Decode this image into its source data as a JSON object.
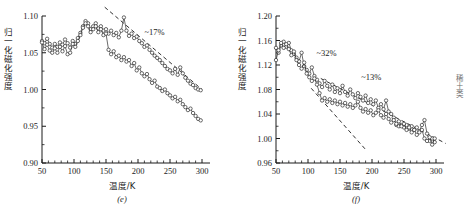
{
  "figure": {
    "edge_text": "稀土类",
    "panels": [
      {
        "id": "e",
        "panel_label": "(e)",
        "annotations": [
          {
            "text": "~17%"
          }
        ]
      },
      {
        "id": "f",
        "panel_label": "(f)",
        "annotations": [
          {
            "text": "~32%"
          },
          {
            "text": "~13%"
          }
        ]
      }
    ]
  },
  "chart_data": [
    {
      "type": "line",
      "id": "e",
      "title": "",
      "panel_label": "(e)",
      "xlabel": "温度/K",
      "ylabel": "归一化磁化强度",
      "xlim": [
        50,
        300
      ],
      "ylim": [
        0.9,
        1.1
      ],
      "xticks": [
        50,
        100,
        150,
        200,
        250,
        300
      ],
      "yticks": [
        0.9,
        0.95,
        1.0,
        1.05,
        1.1
      ],
      "grid": false,
      "legend": "none",
      "marker": "open-circle",
      "annotations": [
        {
          "text": "~17%",
          "x": 232,
          "y": 1.077
        }
      ],
      "trend_lines": [
        {
          "style": "dashed",
          "x": [
            148,
            300
          ],
          "y": [
            1.112,
            1.0
          ]
        }
      ],
      "series": [
        {
          "name": "upper-curve",
          "x": [
            50,
            54,
            58,
            62,
            66,
            70,
            74,
            78,
            82,
            86,
            90,
            94,
            98,
            102,
            106,
            110,
            114,
            118,
            122,
            126,
            130,
            134,
            138,
            142,
            146,
            150,
            154,
            158,
            162,
            166,
            170,
            174,
            178,
            182,
            186,
            190,
            194,
            198,
            202,
            206,
            210,
            214,
            218,
            222,
            226,
            230,
            234,
            238,
            242,
            246,
            250,
            254,
            258,
            262,
            266,
            270,
            274,
            278,
            282,
            286,
            290,
            294,
            298
          ],
          "y": [
            1.066,
            1.063,
            1.069,
            1.062,
            1.057,
            1.062,
            1.058,
            1.064,
            1.061,
            1.068,
            1.063,
            1.057,
            1.066,
            1.062,
            1.07,
            1.077,
            1.086,
            1.093,
            1.09,
            1.082,
            1.086,
            1.09,
            1.083,
            1.086,
            1.08,
            1.082,
            1.076,
            1.08,
            1.074,
            1.077,
            1.071,
            1.08,
            1.098,
            1.08,
            1.073,
            1.076,
            1.07,
            1.072,
            1.066,
            1.063,
            1.058,
            1.06,
            1.054,
            1.05,
            1.046,
            1.043,
            1.04,
            1.036,
            1.032,
            1.028,
            1.026,
            1.022,
            1.028,
            1.02,
            1.03,
            1.022,
            1.016,
            1.012,
            1.008,
            1.006,
            1.002,
            1.0,
            0.999
          ]
        },
        {
          "name": "lower-curve",
          "x": [
            50,
            54,
            58,
            62,
            66,
            70,
            74,
            78,
            82,
            86,
            90,
            94,
            98,
            102,
            106,
            110,
            114,
            118,
            122,
            126,
            130,
            134,
            138,
            142,
            146,
            150,
            154,
            158,
            162,
            166,
            170,
            174,
            178,
            182,
            186,
            190,
            194,
            198,
            202,
            206,
            210,
            214,
            218,
            222,
            226,
            230,
            234,
            238,
            242,
            246,
            250,
            254,
            258,
            262,
            266,
            270,
            274,
            278,
            282,
            286,
            290,
            294,
            298
          ],
          "y": [
            1.064,
            1.055,
            1.061,
            1.053,
            1.05,
            1.056,
            1.05,
            1.058,
            1.052,
            1.059,
            1.048,
            1.05,
            1.062,
            1.058,
            1.066,
            1.074,
            1.084,
            1.09,
            1.086,
            1.078,
            1.082,
            1.086,
            1.078,
            1.082,
            1.074,
            1.076,
            1.054,
            1.048,
            1.052,
            1.044,
            1.046,
            1.04,
            1.044,
            1.038,
            1.04,
            1.032,
            1.036,
            1.026,
            1.03,
            1.022,
            1.018,
            1.021,
            1.014,
            1.009,
            1.012,
            1.004,
            1.002,
            0.998,
            1.0,
            0.995,
            0.992,
            0.988,
            0.99,
            0.984,
            0.986,
            0.98,
            0.976,
            0.972,
            0.974,
            0.968,
            0.964,
            0.96,
            0.958
          ]
        }
      ]
    },
    {
      "type": "line",
      "id": "f",
      "title": "",
      "panel_label": "(f)",
      "xlabel": "温度/K",
      "ylabel": "归一化磁化强度",
      "xlim": [
        50,
        300
      ],
      "ylim": [
        0.96,
        1.2
      ],
      "xticks": [
        50,
        100,
        150,
        200,
        250,
        300
      ],
      "yticks": [
        0.96,
        1.0,
        1.04,
        1.08,
        1.12,
        1.16,
        1.2
      ],
      "grid": false,
      "legend": "none",
      "marker": "open-circle",
      "annotations": [
        {
          "text": "~32%",
          "x": 135,
          "y": 1.138
        },
        {
          "text": "~13%",
          "x": 205,
          "y": 1.098
        }
      ],
      "trend_lines": [
        {
          "style": "dashed",
          "x": [
            120,
            315
          ],
          "y": [
            1.098,
            0.992
          ]
        },
        {
          "style": "dashed",
          "x": [
            105,
            190
          ],
          "y": [
            1.082,
            0.982
          ]
        }
      ],
      "series": [
        {
          "name": "curve-a",
          "x": [
            50,
            54,
            58,
            62,
            66,
            70,
            74,
            78,
            82,
            86,
            90,
            94,
            98,
            102,
            106,
            110,
            114,
            118,
            122,
            126,
            130,
            134,
            138,
            142,
            146,
            150,
            154,
            158,
            162,
            166,
            170,
            174,
            178,
            182,
            186,
            190,
            194,
            198,
            202,
            206,
            210,
            214,
            218,
            222,
            226,
            230,
            234,
            238,
            242,
            246,
            250,
            254,
            258,
            262,
            266,
            270,
            274,
            278,
            282,
            286,
            290,
            294,
            298
          ],
          "y": [
            1.148,
            1.14,
            1.152,
            1.158,
            1.15,
            1.156,
            1.144,
            1.138,
            1.132,
            1.126,
            1.14,
            1.118,
            1.112,
            1.106,
            1.116,
            1.102,
            1.096,
            1.09,
            1.084,
            1.094,
            1.086,
            1.08,
            1.088,
            1.076,
            1.082,
            1.074,
            1.086,
            1.076,
            1.07,
            1.08,
            1.072,
            1.066,
            1.074,
            1.068,
            1.062,
            1.07,
            1.058,
            1.064,
            1.056,
            1.062,
            1.05,
            1.056,
            1.048,
            1.062,
            1.044,
            1.04,
            1.034,
            1.022,
            1.02,
            1.022,
            1.018,
            1.022,
            1.016,
            1.02,
            1.014,
            1.018,
            1.012,
            1.022,
            1.03,
            1.008,
            0.996,
            1.0,
            0.994
          ]
        },
        {
          "name": "curve-b",
          "x": [
            50,
            54,
            58,
            62,
            66,
            70,
            74,
            78,
            82,
            86,
            90,
            94,
            98,
            102,
            106,
            110,
            114,
            118,
            122,
            126,
            130,
            134,
            138,
            142,
            146,
            150,
            154,
            158,
            162,
            166,
            170,
            174,
            178,
            182,
            186,
            190,
            194,
            198,
            202,
            206,
            210,
            214,
            218,
            222,
            226,
            230,
            234,
            238,
            242,
            246,
            250,
            254,
            258,
            262,
            266,
            270,
            274,
            278,
            282,
            286,
            290,
            294,
            298
          ],
          "y": [
            1.128,
            1.144,
            1.156,
            1.148,
            1.154,
            1.146,
            1.136,
            1.142,
            1.128,
            1.12,
            1.114,
            1.124,
            1.106,
            1.1,
            1.094,
            1.098,
            1.088,
            1.074,
            1.062,
            1.066,
            1.06,
            1.064,
            1.058,
            1.062,
            1.056,
            1.06,
            1.054,
            1.058,
            1.052,
            1.056,
            1.05,
            1.054,
            1.06,
            1.05,
            1.044,
            1.048,
            1.042,
            1.046,
            1.038,
            1.042,
            1.046,
            1.038,
            1.034,
            1.04,
            1.032,
            1.026,
            1.03,
            1.024,
            1.028,
            1.02,
            1.024,
            1.014,
            1.018,
            1.01,
            1.014,
            1.006,
            1.01,
            1.014,
            1.0,
            0.996,
            1.002,
            0.99,
            1.0
          ]
        }
      ]
    }
  ]
}
